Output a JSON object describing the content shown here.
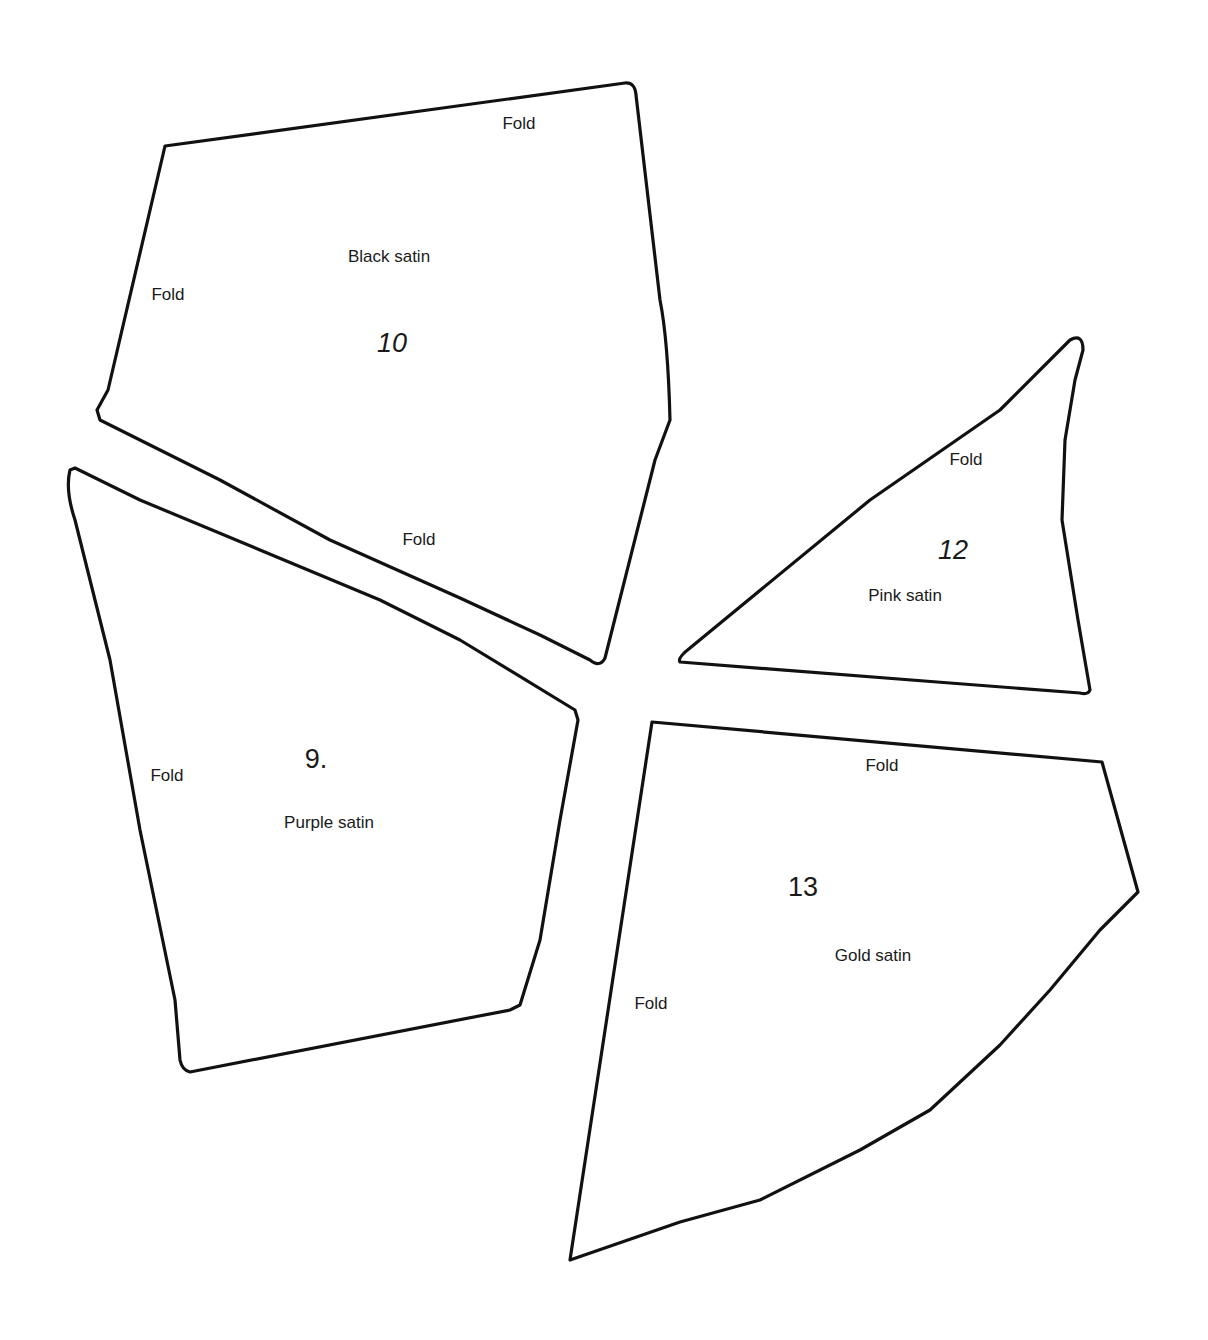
{
  "pieces": [
    {
      "id": "10",
      "number_label": "10",
      "material": "Black satin",
      "fold_labels": [
        "Fold",
        "Fold",
        "Fold"
      ]
    },
    {
      "id": "9",
      "number_label": "9.",
      "material": "Purple satin",
      "fold_labels": [
        "Fold"
      ]
    },
    {
      "id": "12",
      "number_label": "12",
      "material": "Pink satin",
      "fold_labels": [
        "Fold"
      ]
    },
    {
      "id": "13",
      "number_label": "13",
      "material": "Gold satin",
      "fold_labels": [
        "Fold",
        "Fold"
      ]
    }
  ],
  "colors": {
    "outline": "#111111",
    "background": "#ffffff",
    "text": "#1a1a1a"
  }
}
